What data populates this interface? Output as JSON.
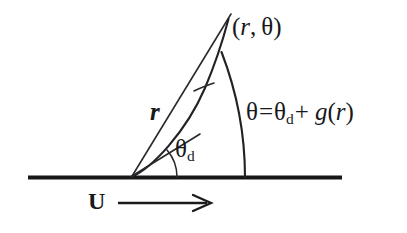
{
  "figure": {
    "background_color": "#ffffff",
    "ink_color": "#1b1b1e"
  },
  "labels": {
    "point": {
      "text": "(r, θ)",
      "open_paren": "(",
      "radius_symbol": "r",
      "comma": ",",
      "angle_symbol": "θ",
      "close_paren": ")"
    },
    "equation": {
      "text": "θ = θd + g(r)",
      "lhs": "θ",
      "equals": "=",
      "theta": "θ",
      "theta_subscript": "d",
      "plus": "+",
      "function_name": "g",
      "func_open": "(",
      "func_arg": "r",
      "func_close": ")"
    },
    "radius": {
      "text": "r"
    },
    "deflection_angle": {
      "symbol": "θ",
      "subscript": "d"
    },
    "flow": {
      "text": "U",
      "arrow_glyph": "⟶"
    }
  },
  "geometry": {
    "vertex": {
      "x": 131,
      "y": 177
    },
    "baseline": {
      "x1": 28,
      "y1": 177.5,
      "x2": 342,
      "y2": 177.5
    },
    "straight_ray": {
      "x1": 131,
      "y1": 177,
      "x2": 231,
      "y2": 14
    },
    "spiral_end": {
      "x": 228,
      "y": 20
    },
    "large_arc": {
      "start_x": 245,
      "start_y": 177,
      "end_x": 222,
      "end_y": 52
    },
    "small_arc_theta_d": {
      "radius": 46
    },
    "flow_arrow": {
      "x1": 118,
      "y1": 203,
      "x2": 210,
      "y2": 203
    }
  }
}
